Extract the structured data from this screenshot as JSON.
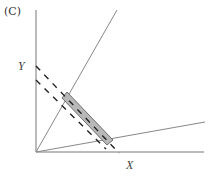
{
  "figure": {
    "panel_label": "(C)",
    "axis_labels": {
      "y": "Y",
      "x": "X"
    },
    "colors": {
      "line": "#777777",
      "dash": "#222222",
      "shade_fill": "#b8b8b8",
      "shade_stroke": "#444444"
    },
    "geometry": {
      "origin": [
        36,
        152
      ],
      "y_axis_end": [
        36,
        10
      ],
      "x_axis_end": [
        204,
        152
      ],
      "steep_ray_end": [
        117,
        10
      ],
      "shallow_ray_end": [
        205,
        122
      ],
      "outer_budget_line": {
        "from": [
          36,
          66
        ],
        "to": [
          119,
          153
        ]
      },
      "inner_budget_line": {
        "from": [
          36,
          80
        ],
        "to": [
          106,
          149
        ]
      },
      "shaded_region": [
        [
          62,
          98
        ],
        [
          67,
          92
        ],
        [
          113,
          140
        ],
        [
          107,
          145
        ]
      ]
    }
  }
}
